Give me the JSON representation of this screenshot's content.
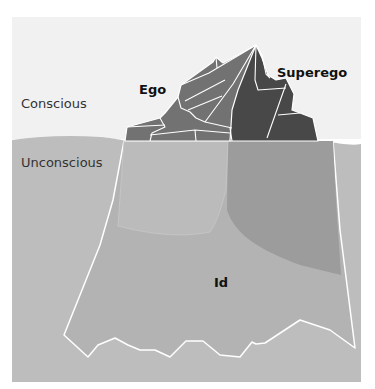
{
  "diagram": {
    "title": "",
    "zones": {
      "conscious": "Conscious",
      "unconscious": "Unconscious"
    },
    "structures": {
      "ego": "Ego",
      "superego": "Superego",
      "id": "Id"
    },
    "colors": {
      "sky": "#f1f1f1",
      "water": "#bdbdbd",
      "ego_top": "#707070",
      "superego_top": "#474747",
      "id_under": "#b0b0b0",
      "superego_under": "#9a9a9a",
      "outline": "#ffffff"
    }
  }
}
